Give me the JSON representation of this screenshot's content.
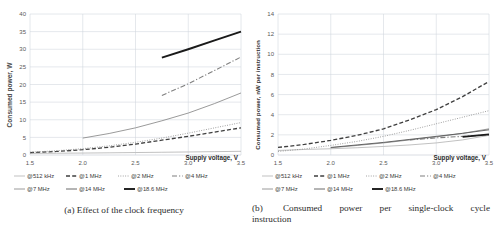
{
  "figure": {
    "panels": [
      {
        "id": "a",
        "caption_label": "(a)",
        "caption_text": "Effect of the clock frequency"
      },
      {
        "id": "b",
        "caption_label": "(b)",
        "caption_words": [
          "Consumed",
          "power",
          "per",
          "single-clock",
          "cycle"
        ],
        "caption_line2": "instruction"
      }
    ]
  },
  "legend": {
    "entries": [
      {
        "label": "@512 kHz",
        "style": "solid-thin",
        "color": "#a6a6a6"
      },
      {
        "label": "@1 MHz",
        "style": "dashed",
        "color": "#3f3f3f"
      },
      {
        "label": "@2 MHz",
        "style": "dotted",
        "color": "#8c8c8c"
      },
      {
        "label": "@4 MHz",
        "style": "dash-dot",
        "color": "#7f7f7f"
      },
      {
        "label": "@7 MHz",
        "style": "solid",
        "color": "#808080"
      },
      {
        "label": "@14 MHz",
        "style": "solid-med",
        "color": "#595959"
      },
      {
        "label": "@18.6 MHz",
        "style": "solid-bold",
        "color": "#1a1a1a"
      }
    ]
  },
  "chart_data": [
    {
      "type": "line",
      "title": "",
      "panel": "a",
      "xlabel": "Supply voltage, V",
      "ylabel": "Consumed power, W",
      "xlim": [
        1.5,
        3.5
      ],
      "ylim": [
        0,
        40
      ],
      "xticks": [
        "1.5",
        "2.0",
        "2.5",
        "3.0",
        "3.5"
      ],
      "yticks": [
        "0",
        "5",
        "10",
        "15",
        "20",
        "25",
        "30",
        "35",
        "40"
      ],
      "grid": true,
      "legend_position": "bottom",
      "x": [
        1.5,
        1.75,
        2.0,
        2.25,
        2.5,
        2.75,
        3.0,
        3.25,
        3.5
      ],
      "series": [
        {
          "name": "@512 kHz",
          "values": [
            0.45,
            0.5,
            0.55,
            0.62,
            0.7,
            0.78,
            0.86,
            0.95,
            1.05
          ]
        },
        {
          "name": "@1 MHz",
          "values": [
            0.7,
            1.0,
            1.5,
            2.2,
            3.1,
            4.2,
            5.3,
            6.5,
            7.7
          ]
        },
        {
          "name": "@2 MHz",
          "values": [
            0.8,
            1.2,
            1.8,
            2.6,
            3.6,
            4.8,
            6.2,
            7.7,
            9.2
          ]
        },
        {
          "name": "@4 MHz",
          "values": [
            null,
            null,
            null,
            null,
            null,
            16.9,
            20.2,
            24.0,
            27.8
          ]
        },
        {
          "name": "@7 MHz",
          "values": [
            null,
            null,
            4.8,
            6.1,
            7.7,
            9.7,
            11.9,
            14.6,
            17.6
          ]
        },
        {
          "name": "@14 MHz",
          "values": [
            null,
            null,
            null,
            null,
            null,
            null,
            null,
            null,
            null
          ]
        },
        {
          "name": "@18.6 MHz",
          "values": [
            null,
            null,
            null,
            null,
            null,
            27.6,
            30.0,
            32.5,
            35.0
          ]
        }
      ]
    },
    {
      "type": "line",
      "title": "",
      "panel": "b",
      "xlabel": "Supply voltage, V",
      "ylabel": "Consumed power, nW per instruction",
      "xlim": [
        1.5,
        3.5
      ],
      "ylim": [
        0,
        14
      ],
      "xticks": [
        "1.5",
        "2.0",
        "2.5",
        "3.0",
        "3.5"
      ],
      "yticks": [
        "0",
        "2",
        "4",
        "6",
        "8",
        "10",
        "12",
        "14"
      ],
      "grid": true,
      "legend_position": "bottom",
      "x": [
        1.5,
        1.75,
        2.0,
        2.25,
        2.5,
        2.75,
        3.0,
        3.25,
        3.5
      ],
      "series": [
        {
          "name": "@512 kHz",
          "values": [
            0.45,
            0.55,
            0.62,
            0.72,
            0.85,
            1.0,
            1.2,
            1.5,
            1.95
          ]
        },
        {
          "name": "@1 MHz",
          "values": [
            0.75,
            1.05,
            1.45,
            1.95,
            2.6,
            3.5,
            4.5,
            5.8,
            7.3
          ]
        },
        {
          "name": "@2 MHz",
          "values": [
            0.35,
            0.6,
            0.95,
            1.35,
            1.85,
            2.45,
            3.1,
            3.75,
            4.4
          ]
        },
        {
          "name": "@4 MHz",
          "values": [
            null,
            null,
            null,
            null,
            null,
            1.5,
            1.7,
            1.85,
            2.0
          ]
        },
        {
          "name": "@7 MHz",
          "values": [
            null,
            null,
            0.72,
            0.95,
            1.2,
            1.5,
            1.8,
            2.15,
            2.6
          ]
        },
        {
          "name": "@14 MHz",
          "values": [
            null,
            null,
            0.75,
            1.0,
            1.25,
            1.55,
            1.85,
            2.15,
            2.5
          ]
        },
        {
          "name": "@18.6 MHz",
          "values": [
            null,
            null,
            null,
            null,
            null,
            null,
            null,
            1.8,
            2.05
          ]
        }
      ]
    }
  ]
}
